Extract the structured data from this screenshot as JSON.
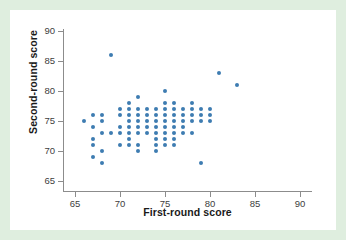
{
  "figure": {
    "background_color": "#ffffff",
    "page_background_color": "#dfeedf",
    "axis_color": "#8c8c8c",
    "marker_color": "#3e7cb1"
  },
  "chart_data": {
    "type": "scatter",
    "title": "",
    "xlabel": "First-round score",
    "ylabel": "Second-round score",
    "xlim": [
      63,
      92
    ],
    "ylim": [
      63.5,
      91.5
    ],
    "xticks": [
      65,
      70,
      75,
      80,
      85,
      90
    ],
    "yticks": [
      65,
      70,
      75,
      80,
      85,
      90
    ],
    "xticklabels": [
      "65",
      "70",
      "75",
      "80",
      "85",
      "90"
    ],
    "yticklabels": [
      "65",
      "70",
      "75",
      "80",
      "85",
      "90"
    ],
    "grid": false,
    "legend": false,
    "marker": "circle",
    "points": [
      [
        66,
        75
      ],
      [
        67,
        76
      ],
      [
        67,
        74
      ],
      [
        67,
        72
      ],
      [
        67,
        71
      ],
      [
        67,
        69
      ],
      [
        68,
        76
      ],
      [
        68,
        75
      ],
      [
        68,
        73
      ],
      [
        68,
        70
      ],
      [
        68,
        68
      ],
      [
        69,
        86
      ],
      [
        69,
        73
      ],
      [
        70,
        77
      ],
      [
        70,
        76
      ],
      [
        70,
        74
      ],
      [
        70,
        73
      ],
      [
        70,
        71
      ],
      [
        71,
        78
      ],
      [
        71,
        77
      ],
      [
        71,
        76
      ],
      [
        71,
        75
      ],
      [
        71,
        74
      ],
      [
        71,
        73
      ],
      [
        71,
        72
      ],
      [
        71,
        71
      ],
      [
        72,
        79
      ],
      [
        72,
        77
      ],
      [
        72,
        76
      ],
      [
        72,
        75
      ],
      [
        72,
        74
      ],
      [
        72,
        73
      ],
      [
        72,
        71
      ],
      [
        72,
        70
      ],
      [
        73,
        77
      ],
      [
        73,
        76
      ],
      [
        73,
        75
      ],
      [
        73,
        74
      ],
      [
        73,
        73
      ],
      [
        74,
        77
      ],
      [
        74,
        76
      ],
      [
        74,
        75
      ],
      [
        74,
        74
      ],
      [
        74,
        73
      ],
      [
        74,
        72
      ],
      [
        74,
        71
      ],
      [
        74,
        70
      ],
      [
        75,
        80
      ],
      [
        75,
        78
      ],
      [
        75,
        77
      ],
      [
        75,
        76
      ],
      [
        75,
        75
      ],
      [
        75,
        74
      ],
      [
        75,
        73
      ],
      [
        75,
        72
      ],
      [
        75,
        71
      ],
      [
        76,
        78
      ],
      [
        76,
        77
      ],
      [
        76,
        76
      ],
      [
        76,
        75
      ],
      [
        76,
        74
      ],
      [
        76,
        73
      ],
      [
        76,
        72
      ],
      [
        76,
        71
      ],
      [
        77,
        77
      ],
      [
        77,
        76
      ],
      [
        77,
        75
      ],
      [
        77,
        74
      ],
      [
        77,
        73
      ],
      [
        78,
        78
      ],
      [
        78,
        77
      ],
      [
        78,
        76
      ],
      [
        78,
        75
      ],
      [
        78,
        73
      ],
      [
        79,
        77
      ],
      [
        79,
        76
      ],
      [
        79,
        75
      ],
      [
        79,
        68
      ],
      [
        80,
        77
      ],
      [
        80,
        76
      ],
      [
        80,
        75
      ],
      [
        81,
        83
      ],
      [
        83,
        81
      ]
    ]
  }
}
